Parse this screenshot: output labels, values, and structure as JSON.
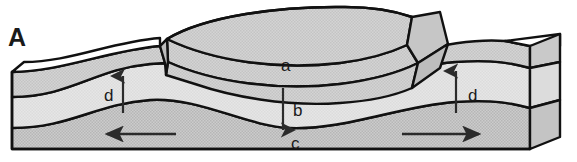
{
  "figure": {
    "panel_letter": "A",
    "type": "geologic-block-diagram",
    "background_color": "#ffffff",
    "outline_color": "#111111",
    "width": 577,
    "height": 162
  },
  "layers": [
    {
      "id": "upper-remnant-cap",
      "label": "",
      "fill_color": "#c9c9c9",
      "description": "thin upper bed of the raised erosional remnant"
    },
    {
      "id": "layer-a",
      "label": "a",
      "fill_color": "#cfcfcf",
      "description": "upper folded rock unit forming the raised central remnant"
    },
    {
      "id": "layer-b",
      "label": "b",
      "fill_color": "#e2e2e2",
      "description": "middle rock unit"
    },
    {
      "id": "layer-c",
      "label": "c",
      "fill_color": "#c4c4c4",
      "description": "lower rock unit at the base of the block"
    }
  ],
  "labels": {
    "panel": "A",
    "a": "a",
    "b": "b",
    "c": "c",
    "d_left": "d",
    "d_right": "d"
  },
  "annotations": [
    {
      "name": "uplift-arrow-left",
      "label": "d",
      "direction": "up",
      "x": 123,
      "y_start": 112,
      "y_end": 78
    },
    {
      "name": "downfold-arrow-center",
      "label": "b",
      "direction": "down",
      "x": 283,
      "y_start": 88,
      "y_end": 128
    },
    {
      "name": "uplift-arrow-right",
      "label": "d",
      "direction": "up",
      "x": 456,
      "y_start": 112,
      "y_end": 73
    },
    {
      "name": "extension-arrow-left",
      "label": "",
      "direction": "left",
      "y": 134,
      "x_start": 175,
      "x_end": 108
    },
    {
      "name": "extension-arrow-right",
      "label": "",
      "direction": "right",
      "y": 134,
      "x_start": 403,
      "x_end": 478
    }
  ]
}
